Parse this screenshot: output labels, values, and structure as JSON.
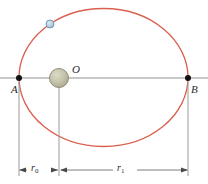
{
  "figure": {
    "type": "orbital-diagram",
    "labels": {
      "point_a": "A",
      "point_b": "B",
      "center": "O",
      "r0_symbol": "r",
      "r0_subscript": "0",
      "r1_symbol": "r",
      "r1_subscript": "1"
    },
    "colors": {
      "orbit": "#d9604f",
      "axis": "#8f8f8f",
      "dimension": "#7d7d7d",
      "marker": "#111111",
      "central_body_fill": "#bdbba4",
      "central_body_edge": "#8f8d78",
      "satellite_fill": "#b8d0e0",
      "satellite_edge": "#6f93ab",
      "text": "#2b2b2b",
      "background": "#ffffff"
    },
    "geometry": {
      "ellipse_center_x": 103.5,
      "ellipse_center_y": 77.5,
      "ellipse_semi_major": 84.5,
      "ellipse_semi_minor": 69.0,
      "point_a_x": 19,
      "point_a_y": 77.5,
      "point_b_x": 188,
      "point_b_y": 77.5,
      "focus_x": 59,
      "focus_y": 78,
      "central_body_radius": 9.5,
      "satellite_x": 50,
      "satellite_y": 24,
      "satellite_radius": 4,
      "dimension_line_y": 170,
      "axis_line_y": 78
    }
  }
}
